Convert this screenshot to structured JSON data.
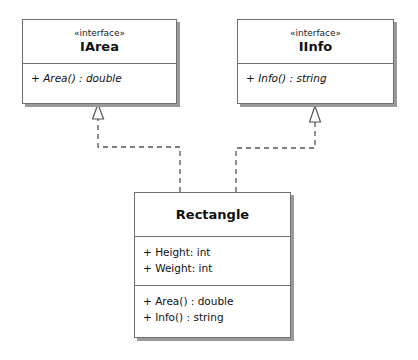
{
  "diagram": {
    "type": "UML class diagram",
    "classes": [
      {
        "id": "iarea",
        "stereotype": "«interface»",
        "name": "IArea",
        "attributes": [],
        "operations": [
          "+ Area() : double"
        ]
      },
      {
        "id": "iinfo",
        "stereotype": "«interface»",
        "name": "IInfo",
        "attributes": [],
        "operations": [
          "+ Info() : string"
        ]
      },
      {
        "id": "rectangle",
        "stereotype": "",
        "name": "Rectangle",
        "attributes": [
          "+ Height: int",
          "+ Weight: int"
        ],
        "operations": [
          "+ Area() : double",
          "+ Info() : string"
        ]
      }
    ],
    "relationships": [
      {
        "type": "realization",
        "from": "Rectangle",
        "to": "IArea"
      },
      {
        "type": "realization",
        "from": "Rectangle",
        "to": "IInfo"
      }
    ],
    "colors": {
      "border": "#6e6e6e",
      "shadow": "#9a9a9a",
      "line": "#555555",
      "background": "#ffffff"
    }
  }
}
